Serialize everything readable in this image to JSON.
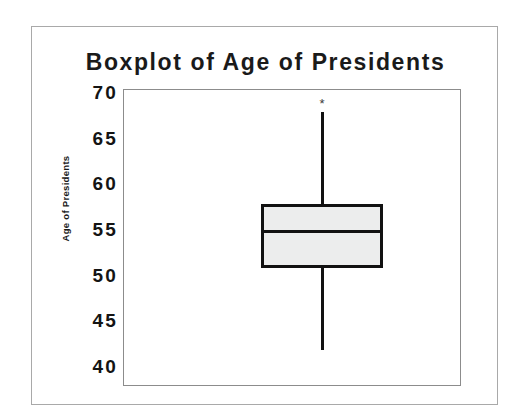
{
  "chart": {
    "title": "Boxplot of Age of Presidents",
    "y_axis_title": "Age of Presidents",
    "outlier_symbol": "*"
  },
  "chart_data": {
    "type": "box",
    "title": "Boxplot of Age of Presidents",
    "xlabel": "",
    "ylabel": "Age of Presidents",
    "ylim": [
      40,
      70
    ],
    "yticks": [
      70,
      65,
      60,
      55,
      50,
      45,
      40
    ],
    "ytick_labels": [
      "70",
      "65",
      "60",
      "55",
      "50",
      "45",
      "40"
    ],
    "grid": false,
    "legend": "none",
    "orientation": "vertical",
    "categories": [
      "Age of Presidents"
    ],
    "boxes": [
      {
        "label": "Age of Presidents",
        "min_whisker": 42,
        "q1": 51,
        "median": 55,
        "q3": 58,
        "max_whisker": 68,
        "outliers": [
          69
        ]
      }
    ]
  },
  "axis_ticks": [
    {
      "value": 70,
      "label": "70"
    },
    {
      "value": 65,
      "label": "65"
    },
    {
      "value": 60,
      "label": "60"
    },
    {
      "value": 55,
      "label": "55"
    },
    {
      "value": 50,
      "label": "50"
    },
    {
      "value": 45,
      "label": "45"
    },
    {
      "value": 40,
      "label": "40"
    }
  ],
  "colors": {
    "box_fill": "#eceded",
    "box_stroke": "#111111",
    "frame": "#8c8c8c",
    "outer_frame": "#a9a9a9",
    "text": "#141414",
    "background": "#ffffff"
  }
}
